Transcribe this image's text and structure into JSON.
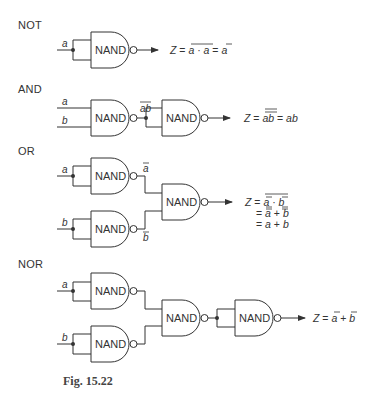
{
  "sections": [
    {
      "label": "NOT",
      "output_expr": [
        "Z = ",
        "a · a",
        " = ",
        "a"
      ],
      "inputs": [
        "a"
      ]
    },
    {
      "label": "AND",
      "output_expr": [
        "Z = ",
        "ab",
        " = ab"
      ],
      "intermediate": "ab",
      "inputs": [
        "a",
        "b"
      ]
    },
    {
      "label": "OR",
      "output_expr_lines": [
        "Z = a · b",
        "= a + b",
        "= a + b"
      ],
      "intermediate": [
        "a",
        "b"
      ],
      "inputs": [
        "a",
        "b"
      ]
    },
    {
      "label": "NOR",
      "output_expr": [
        "Z = ",
        "a",
        " + ",
        "b"
      ],
      "inputs": [
        "a",
        "b"
      ]
    }
  ],
  "gate_label": "NAND",
  "caption": "Fig. 15.22",
  "colors": {
    "line": "#333333",
    "background": "#ffffff"
  }
}
